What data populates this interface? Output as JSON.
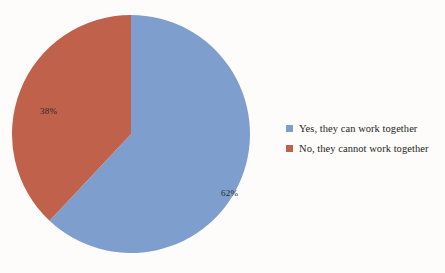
{
  "chart_data": {
    "type": "pie",
    "title": "",
    "categories": [
      "Yes, they can work together",
      "No, they cannot work together"
    ],
    "values": [
      62,
      38
    ],
    "value_labels": [
      "62%",
      "38%"
    ],
    "colors": [
      "#7e9fcd",
      "#c0614b"
    ],
    "legend_position": "right",
    "grid": false,
    "start_angle_deg": 0,
    "direction": "clockwise"
  },
  "pie": {
    "slices": [
      {
        "label": "Yes, they can work together",
        "percent_label": "62%",
        "value": 62,
        "color": "#7e9fcd"
      },
      {
        "label": "No, they cannot work together",
        "percent_label": "38%",
        "value": 38,
        "color": "#c0614b"
      }
    ]
  },
  "legend": {
    "items": [
      {
        "label": "Yes, they can work together",
        "color": "#7e9fcd"
      },
      {
        "label": "No, they cannot work together",
        "color": "#c0614b"
      }
    ]
  },
  "colors": {
    "background": "#fdfcfa",
    "yes_blue": "#7e9fcd",
    "no_red": "#c0614b",
    "label_text": "#2a2a2a",
    "legend_text": "#1d1d1d"
  }
}
